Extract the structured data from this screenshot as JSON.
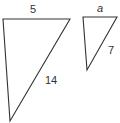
{
  "diagram": {
    "type": "similar-triangles",
    "stroke_color": "#333333",
    "triangles": [
      {
        "id": "large",
        "vertices": [
          [
            3,
            19
          ],
          [
            70,
            19
          ],
          [
            10,
            121
          ]
        ],
        "labels": {
          "top_side": "5",
          "hypotenuse": "14"
        }
      },
      {
        "id": "small",
        "vertices": [
          [
            83,
            17
          ],
          [
            117,
            17
          ],
          [
            87,
            70
          ]
        ],
        "labels": {
          "top_side": "a",
          "hypotenuse": "7"
        }
      }
    ]
  }
}
